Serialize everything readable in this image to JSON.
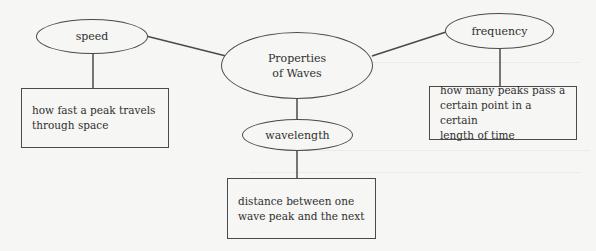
{
  "diagram": {
    "center": {
      "line1": "Properties",
      "line2": "of Waves"
    },
    "nodes": [
      {
        "id": "speed",
        "label": "speed",
        "definition": "how fast a peak travels through space",
        "definition_lines": [
          "how fast a peak travels",
          "through space"
        ]
      },
      {
        "id": "frequency",
        "label": "frequency",
        "definition": "how many peaks pass a certain point in a certain length of time",
        "definition_lines": [
          "how many peaks pass a",
          "certain point in a certain",
          "length of time"
        ]
      },
      {
        "id": "wavelength",
        "label": "wavelength",
        "definition": "distance between one wave peak and the next",
        "definition_lines": [
          "distance between one",
          "wave peak and the next"
        ]
      }
    ],
    "colors": {
      "background": "#f6f6f4",
      "stroke": "#4a4a4a",
      "text": "#2f2f2f"
    }
  }
}
